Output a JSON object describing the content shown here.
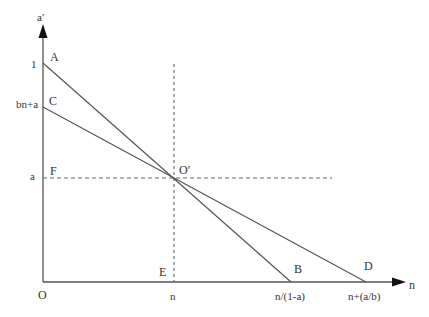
{
  "diagram": {
    "axes": {
      "y_label": "a′",
      "x_label": "n",
      "origin_label": "O"
    },
    "y_ticks": [
      {
        "label": "1",
        "y": 63
      },
      {
        "label": "bn+a",
        "y": 107
      },
      {
        "label": "a",
        "y": 178
      }
    ],
    "x_ticks": [
      {
        "label": "n",
        "x": 174
      },
      {
        "label": "n/(1-a)",
        "x": 291
      },
      {
        "label": "n+(a/b)",
        "x": 366
      }
    ],
    "points": {
      "A": "A",
      "B": "B",
      "C": "C",
      "D": "D",
      "E": "E",
      "F": "F",
      "O_prime": "O′"
    },
    "lines": [
      {
        "name": "AB",
        "from": "A (0,1)",
        "to": "B (n/(1-a),0)"
      },
      {
        "name": "CD",
        "from": "C (0,bn+a)",
        "to": "D (n+(a/b),0)"
      },
      {
        "name": "FO′ dashed",
        "style": "dashed"
      },
      {
        "name": "EO′ dashed",
        "style": "dashed"
      }
    ],
    "colors": {
      "line": "#555555",
      "text": "#333333",
      "dash": "#666666"
    }
  }
}
